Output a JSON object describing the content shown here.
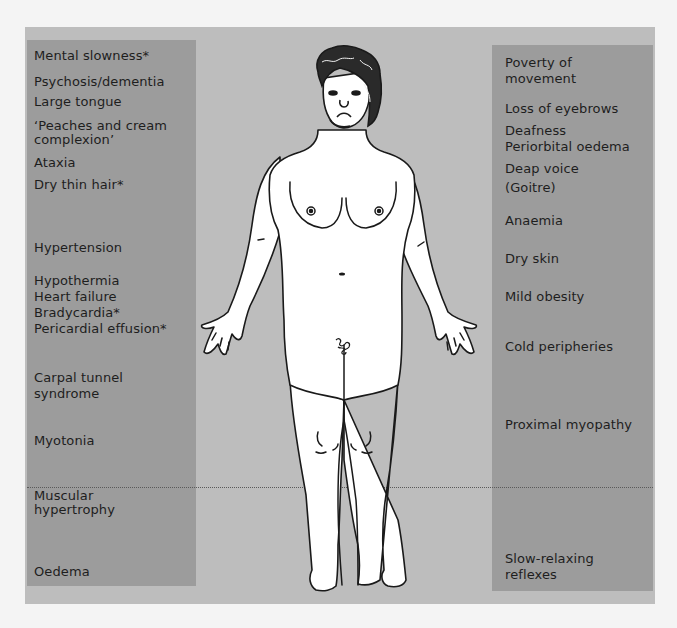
{
  "figure": {
    "colors": {
      "page_background": "#f4f4f4",
      "frame": "#bdbdbd",
      "panels": "#9c9c9c",
      "text": "#1e1e1e",
      "body_fill": "#ffffff",
      "outline": "#1a1a1a"
    }
  },
  "left_labels": [
    "Mental slowness*",
    "Psychosis/dementia",
    "Large tongue",
    "‘Peaches and cream",
    "complexion’",
    "Ataxia",
    "Dry thin hair*",
    "Hypertension",
    "Hypothermia",
    "Heart failure",
    "Bradycardia*",
    "Pericardial effusion*",
    "Carpal tunnel",
    "syndrome",
    "Myotonia",
    "Muscular",
    "hypertrophy",
    "Oedema"
  ],
  "right_labels": [
    "Poverty of",
    "movement",
    "Loss of eyebrows",
    "Deafness",
    "Periorbital oedema",
    "Deap voice",
    "(Goitre)",
    "Anaemia",
    "Dry skin",
    "Mild obesity",
    "Cold peripheries",
    "Proximal myopathy",
    "Slow-relaxing",
    "reflexes"
  ],
  "footnote_marker": "*"
}
